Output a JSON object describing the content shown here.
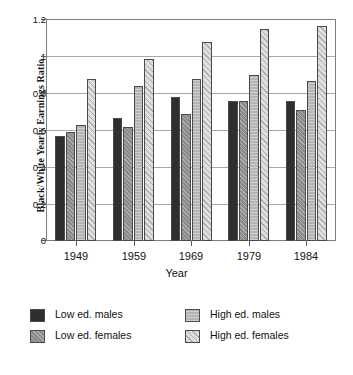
{
  "chart_data": {
    "type": "bar",
    "title": "",
    "subtitle": "",
    "xlabel": "Year",
    "ylabel": "Black/White Yearly Earnings Ratio",
    "categories": [
      "1949",
      "1959",
      "1969",
      "1979",
      "1984"
    ],
    "ylim": [
      0,
      1.2
    ],
    "yticks": [
      0,
      0.2,
      0.4,
      0.6,
      0.8,
      1,
      1.2
    ],
    "ytick_labels": [
      "0",
      "0.2",
      "0.4",
      "0.6",
      "0.8",
      "1",
      "1.2"
    ],
    "grid": true,
    "legend_position": "bottom",
    "series": [
      {
        "name": "Low ed. males",
        "key": "low-ed-males",
        "color": "#2f2f2f",
        "values": [
          0.57,
          0.67,
          0.78,
          0.76,
          0.76
        ]
      },
      {
        "name": "Low ed. females",
        "key": "low-ed-females",
        "color": "#8b8b8b",
        "values": [
          0.59,
          0.62,
          0.69,
          0.76,
          0.71
        ]
      },
      {
        "name": "High ed. males",
        "key": "high-ed-males",
        "color": "#b4b4b4",
        "values": [
          0.63,
          0.84,
          0.88,
          0.9,
          0.87
        ]
      },
      {
        "name": "High ed. females",
        "key": "high-ed-females",
        "color": "#dedede",
        "values": [
          0.88,
          0.99,
          1.08,
          1.15,
          1.17
        ]
      }
    ]
  },
  "axes": {
    "y_title": "Black/White Yearly Earnings Ratio",
    "x_title": "Year",
    "y_ticks": [
      "1.2",
      "1",
      "0.8",
      "0.6",
      "0.4",
      "0.2",
      "0"
    ],
    "x_ticks": [
      "1949",
      "1959",
      "1969",
      "1979",
      "1984"
    ]
  },
  "legend": {
    "entries": [
      {
        "label": "Low ed. males",
        "key": "low-ed-males"
      },
      {
        "label": "Low ed. females",
        "key": "low-ed-females"
      },
      {
        "label": "High ed. males",
        "key": "high-ed-males"
      },
      {
        "label": "High ed. females",
        "key": "high-ed-females"
      }
    ]
  }
}
